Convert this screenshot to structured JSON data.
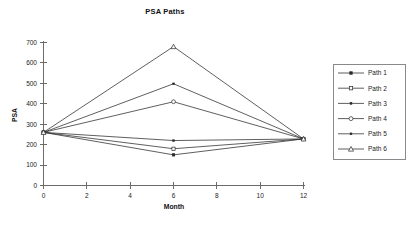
{
  "chart_data": {
    "type": "line",
    "title": "PSA Paths",
    "xlabel": "Month",
    "ylabel": "PSA",
    "x": [
      0,
      6,
      12
    ],
    "xlim": [
      0,
      12
    ],
    "ylim": [
      0,
      700
    ],
    "xticks": [
      "0",
      "2",
      "4",
      "6",
      "8",
      "10",
      "12"
    ],
    "yticks": [
      "0",
      "100",
      "200",
      "300",
      "400",
      "500",
      "600",
      "700"
    ],
    "grid": false,
    "legend_position": "right-outside",
    "series": [
      {
        "name": "Path 1",
        "marker": "filled-square",
        "values": [
          260,
          150,
          228
        ]
      },
      {
        "name": "Path 2",
        "marker": "open-square",
        "values": [
          260,
          180,
          228
        ]
      },
      {
        "name": "Path 3",
        "marker": "small-dot",
        "values": [
          260,
          220,
          228
        ]
      },
      {
        "name": "Path 4",
        "marker": "open-circle",
        "values": [
          260,
          410,
          228
        ]
      },
      {
        "name": "Path 5",
        "marker": "small-dot",
        "values": [
          260,
          498,
          228
        ]
      },
      {
        "name": "Path 6",
        "marker": "open-triangle",
        "values": [
          260,
          680,
          228
        ]
      }
    ],
    "colors": {
      "line": "#2a2a2a",
      "axis": "#6b6b6b",
      "text": "#222222",
      "background": "#ffffff"
    }
  },
  "legend": {
    "items": [
      {
        "label": "Path 1"
      },
      {
        "label": "Path 2"
      },
      {
        "label": "Path 3"
      },
      {
        "label": "Path 4"
      },
      {
        "label": "Path 5"
      },
      {
        "label": "Path 6"
      }
    ]
  }
}
